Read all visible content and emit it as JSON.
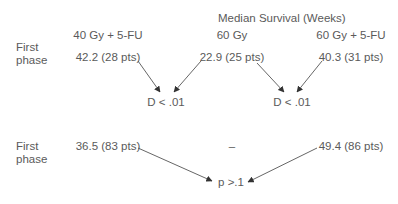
{
  "header": {
    "title": "Median Survival (Weeks)"
  },
  "columns": [
    {
      "label": "40 Gy + 5-FU"
    },
    {
      "label": "60 Gy"
    },
    {
      "label": "60 Gy + 5-FU"
    }
  ],
  "rows": [
    {
      "label_line1": "First",
      "label_line2": "phase",
      "values": [
        "42.2 (28 pts)",
        "22.9 (25 pts)",
        "40.3 (31 pts)"
      ],
      "comparisons": [
        "D < .01",
        "D < .01"
      ]
    },
    {
      "label_line1": "First",
      "label_line2": "phase",
      "values": [
        "36.5 (83 pts)",
        "–",
        "49.4 (86 pts)"
      ],
      "comparisons": [
        "p >.1"
      ]
    }
  ],
  "colors": {
    "text": "#5a5a5a",
    "arrow": "#444444",
    "background": "#ffffff"
  }
}
